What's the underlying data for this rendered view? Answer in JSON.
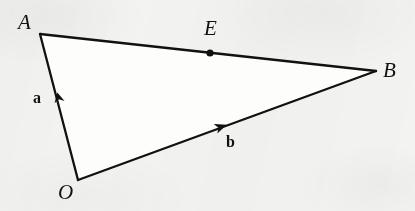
{
  "figure": {
    "background_color": "#f3f3f1",
    "ink_color": "#111111",
    "stroke_width_px": 2,
    "ghost_text": "",
    "points": [
      {
        "id": "A",
        "label": "A",
        "style": "italic-serif",
        "x": 40,
        "y": 34,
        "label_x": 18,
        "label_y": 12
      },
      {
        "id": "B",
        "label": "B",
        "style": "italic-serif",
        "x": 376,
        "y": 71,
        "label_x": 383,
        "label_y": 60
      },
      {
        "id": "O",
        "label": "O",
        "style": "italic-serif",
        "x": 78,
        "y": 180,
        "label_x": 58,
        "label_y": 182
      },
      {
        "id": "E",
        "label": "E",
        "style": "italic-serif",
        "x": 210,
        "y": 53,
        "label_x": 204,
        "label_y": 18,
        "dot": true,
        "dot_radius": 3.4
      }
    ],
    "segments": [
      {
        "id": "AB",
        "from": "A",
        "to": "B",
        "arrow": false
      },
      {
        "id": "OA",
        "from": "O",
        "to": "A",
        "arrow": true,
        "vector": "a"
      },
      {
        "id": "OB",
        "from": "O",
        "to": "B",
        "arrow": true,
        "vector": "b"
      }
    ],
    "vectors": [
      {
        "id": "a",
        "label": "a",
        "style": "bold-roman",
        "from": "O",
        "to": "A",
        "label_x": 33,
        "label_y": 90,
        "arrow_tip_x": 57,
        "arrow_tip_y": 92
      },
      {
        "id": "b",
        "label": "b",
        "style": "bold-roman",
        "from": "O",
        "to": "B",
        "label_x": 226,
        "label_y": 134,
        "arrow_tip_x": 225,
        "arrow_tip_y": 125
      }
    ]
  }
}
